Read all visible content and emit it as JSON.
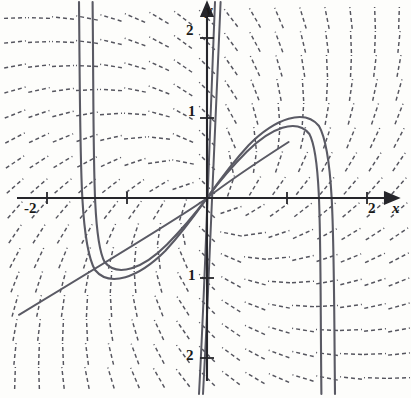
{
  "figure": {
    "kind": "direction-field",
    "background_color": "#fdfdfb",
    "ink_color": "#4a4a52",
    "axis_color": "#26262b",
    "curve_color": "#5c5c66"
  },
  "axes": {
    "x_label": "x",
    "y_label": "y",
    "x_ticks": [
      {
        "value": -2,
        "label": "-2"
      },
      {
        "value": -1,
        "label": ""
      },
      {
        "value": 1,
        "label": ""
      },
      {
        "value": 2,
        "label": "2"
      }
    ],
    "y_ticks": [
      {
        "value": 2,
        "label": "2"
      },
      {
        "value": 1,
        "label": "1"
      },
      {
        "value": -1,
        "label": "1"
      },
      {
        "value": -2,
        "label": "2"
      }
    ],
    "x_range": [
      -2.55,
      2.55
    ],
    "y_range": [
      -2.45,
      2.45
    ],
    "origin_px": [
      207,
      198
    ],
    "unit_px": 80
  },
  "chart_data": {
    "type": "scatter",
    "title": "",
    "xlabel": "x",
    "ylabel": "y",
    "xlim": [
      -2.55,
      2.55
    ],
    "ylim": [
      -2.45,
      2.45
    ],
    "grid": false,
    "legend": "none",
    "field": {
      "name": "direction field",
      "slope_formula": "dy/dx = (x + y) / (x - y)",
      "grid_x": [
        -2.4,
        -2.1,
        -1.8,
        -1.5,
        -1.2,
        -0.9,
        -0.6,
        -0.3,
        0,
        0.3,
        0.6,
        0.9,
        1.2,
        1.5,
        1.8,
        2.1,
        2.4
      ],
      "grid_y": [
        -2.25,
        -1.95,
        -1.65,
        -1.35,
        -1.05,
        -0.75,
        -0.45,
        -0.15,
        0.15,
        0.45,
        0.75,
        1.05,
        1.35,
        1.65,
        1.95,
        2.25
      ],
      "segment_length_px": 22,
      "dash_pattern": "4 3",
      "style": "dashed-tick"
    },
    "solution_curves": [
      {
        "name": "left-branch-outer",
        "type": "u-shape",
        "turning_point": [
          -1.25,
          -0.86
        ]
      },
      {
        "name": "left-branch-inner",
        "type": "u-shape",
        "turning_point": [
          -1.12,
          -0.78
        ]
      },
      {
        "name": "right-branch-outer",
        "type": "arch",
        "turning_point": [
          1.12,
          0.77
        ]
      },
      {
        "name": "right-branch-inner",
        "type": "arch",
        "turning_point": [
          1.0,
          0.7
        ]
      },
      {
        "name": "separatrix-diagonal",
        "type": "line",
        "slope": 0.62
      },
      {
        "name": "steep-center",
        "type": "near-vertical",
        "slope": 9.5
      }
    ],
    "annotations": []
  }
}
